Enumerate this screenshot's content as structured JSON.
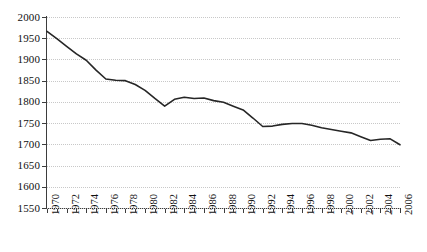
{
  "chart_data": {
    "type": "line",
    "title": "",
    "subtitle": "",
    "xlabel": "",
    "ylabel": "",
    "xlim": [
      1970,
      2006
    ],
    "ylim": [
      1550,
      2000
    ],
    "grid": true,
    "legend": false,
    "legend_position": "none",
    "series_color": "#262626",
    "grid_color": "#c8c8c8",
    "axis_color": "#3d3d3d",
    "y_ticks": [
      1550,
      1600,
      1650,
      1700,
      1750,
      1800,
      1850,
      1900,
      1950,
      2000
    ],
    "x_ticks": [
      1970,
      1971,
      1972,
      1973,
      1974,
      1975,
      1976,
      1977,
      1978,
      1979,
      1980,
      1981,
      1982,
      1983,
      1984,
      1985,
      1986,
      1987,
      1988,
      1989,
      1990,
      1991,
      1992,
      1993,
      1994,
      1995,
      1996,
      1997,
      1998,
      1999,
      2000,
      2001,
      2002,
      2003,
      2004,
      2005,
      2006
    ],
    "x_tick_labels": [
      1970,
      1972,
      1974,
      1976,
      1978,
      1980,
      1982,
      1984,
      1986,
      1988,
      1990,
      1992,
      1994,
      1996,
      1998,
      2000,
      2002,
      2004,
      2006
    ],
    "x": [
      1970,
      1971,
      1972,
      1973,
      1974,
      1975,
      1976,
      1977,
      1978,
      1979,
      1980,
      1981,
      1982,
      1983,
      1984,
      1985,
      1986,
      1987,
      1988,
      1989,
      1990,
      1991,
      1992,
      1993,
      1994,
      1995,
      1996,
      1997,
      1998,
      1999,
      2000,
      2001,
      2002,
      2003,
      2004,
      2005,
      2006
    ],
    "values": [
      1966,
      1949,
      1931,
      1913,
      1898,
      1875,
      1854,
      1851,
      1850,
      1841,
      1827,
      1808,
      1790,
      1806,
      1811,
      1808,
      1809,
      1803,
      1799,
      1790,
      1781,
      1762,
      1742,
      1743,
      1747,
      1749,
      1749,
      1745,
      1739,
      1735,
      1731,
      1727,
      1718,
      1709,
      1712,
      1713,
      1699
    ]
  }
}
